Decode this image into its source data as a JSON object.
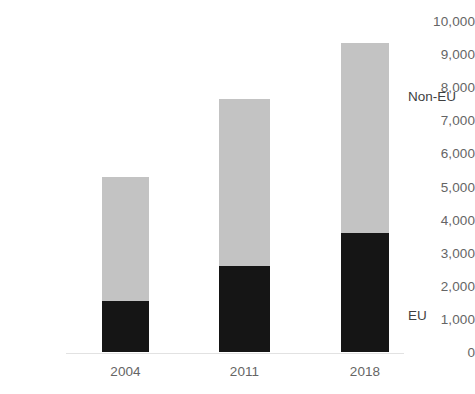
{
  "chart_data": {
    "type": "bar",
    "title": "",
    "xlabel": "",
    "ylabel": "",
    "ylim": [
      0,
      10000
    ],
    "ytick_step": 1000,
    "grid": false,
    "stacked": true,
    "legend_position": "right-inline",
    "categories": [
      "2004",
      "2011",
      "2018"
    ],
    "ytick_labels": [
      "10,000",
      "9,000",
      "8,000",
      "7,000",
      "6,000",
      "5,000",
      "4,000",
      "3,000",
      "2,000",
      "1,000",
      "0"
    ],
    "ytick_values": [
      10000,
      9000,
      8000,
      7000,
      6000,
      5000,
      4000,
      3000,
      2000,
      1000,
      0
    ],
    "series": [
      {
        "name": "EU",
        "color": "#151515",
        "values": [
          1550,
          2600,
          3600
        ]
      },
      {
        "name": "Non-EU",
        "color": "#c3c3c3",
        "values": [
          3750,
          5050,
          5750
        ]
      }
    ],
    "totals": [
      5300,
      7650,
      9350
    ],
    "annotations": [
      {
        "text": "Non-EU",
        "series": "Non-EU"
      },
      {
        "text": "EU",
        "series": "EU"
      }
    ]
  },
  "labels": {
    "non_eu": "Non-EU",
    "eu": "EU"
  },
  "colors": {
    "eu": "#151515",
    "non_eu": "#c3c3c3",
    "axis_text": "#656565",
    "baseline": "#e2e2e2"
  }
}
